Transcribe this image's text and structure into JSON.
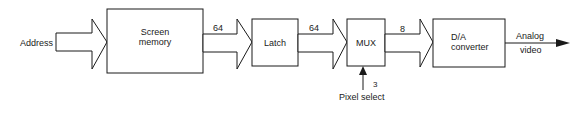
{
  "diagram": {
    "input_label": "Address",
    "blocks": [
      {
        "id": "screen-memory",
        "line1": "Screen",
        "line2": "memory"
      },
      {
        "id": "latch",
        "line1": "Latch"
      },
      {
        "id": "mux",
        "line1": "MUX"
      },
      {
        "id": "da-converter",
        "line1": "D/A",
        "line2": "converter"
      }
    ],
    "bus_widths": {
      "memory_to_latch": "64",
      "latch_to_mux": "64",
      "mux_to_da": "8",
      "pixel_select": "3"
    },
    "control_label": "Pixel select",
    "output_label_line1": "Analog",
    "output_label_line2": "video",
    "colors": {
      "stroke": "#1a1a1a",
      "background": "#ffffff"
    }
  }
}
